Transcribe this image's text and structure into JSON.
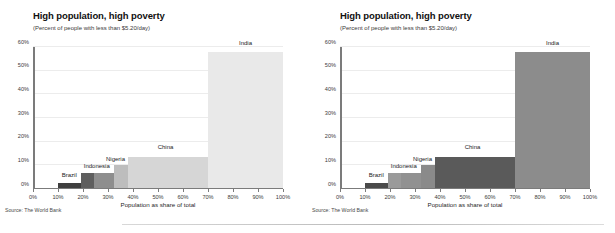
{
  "charts": [
    {
      "id": "chart-left",
      "title": "High population, high poverty",
      "subtitle": "(Percent of people with less than $5.20/day)",
      "source": "Source: The World Bank",
      "xlabel": "Population as share of total"
    },
    {
      "id": "chart-right",
      "title": "High population, high poverty",
      "subtitle": "(Percent of people with less than $5.20/day)",
      "source": "Source: The World Bank",
      "xlabel": "Population as share of total"
    }
  ],
  "chart_data": [
    {
      "type": "bar",
      "variant": "light-palette",
      "title": "High population, high poverty",
      "subtitle": "(Percent of people with less than $5.20/day)",
      "xlabel": "Population as share of total",
      "ylabel": "",
      "source": "Source: The World Bank",
      "xlim": [
        0,
        100
      ],
      "ylim": [
        0,
        60
      ],
      "grid": true,
      "legend": "none",
      "xticks": [
        "0%",
        "10%",
        "20%",
        "30%",
        "40%",
        "50%",
        "60%",
        "70%",
        "80%",
        "90%",
        "100%"
      ],
      "xtick_values": [
        0,
        10,
        20,
        30,
        40,
        50,
        60,
        70,
        80,
        90,
        100
      ],
      "yticks": [
        "0%",
        "10%",
        "20%",
        "30%",
        "40%",
        "50%",
        "60%"
      ],
      "ytick_values": [
        0,
        10,
        20,
        30,
        40,
        50,
        60
      ],
      "bars": [
        {
          "label": "Brazil",
          "x_start": 10.0,
          "x_end": 19.0,
          "value": 2.5,
          "color": "#3f3f3f",
          "label_x": 14.5,
          "label_y": 4.6
        },
        {
          "label": "Indonesia",
          "x_start": 19.0,
          "x_end": 24.5,
          "value": 6.8,
          "color": "#5e5e5e",
          "label_x": 25.5,
          "label_y": 8.3
        },
        {
          "label": "Nigeria",
          "x_start": 24.5,
          "x_end": 32.5,
          "value": 6.8,
          "color": "#8e8e8e",
          "label_x": 33.0,
          "label_y": 11.5
        },
        {
          "label": "",
          "x_start": 32.5,
          "x_end": 38.0,
          "value": 10.0,
          "color": "#bdbdbd",
          "label_x": null,
          "label_y": null
        },
        {
          "label": "China",
          "x_start": 38.0,
          "x_end": 70.0,
          "value": 13.4,
          "color": "#d6d6d6",
          "label_x": 53.0,
          "label_y": 16.3
        },
        {
          "label": "India",
          "x_start": 70.0,
          "x_end": 100.0,
          "value": 57.8,
          "color": "#e9e9e9",
          "label_x": 85.0,
          "label_y": 60.5
        }
      ]
    },
    {
      "type": "bar",
      "variant": "dark-palette",
      "title": "High population, high poverty",
      "subtitle": "(Percent of people with less than $5.20/day)",
      "xlabel": "Population as share of total",
      "ylabel": "",
      "source": "Source: The World Bank",
      "xlim": [
        0,
        100
      ],
      "ylim": [
        0,
        60
      ],
      "grid": true,
      "legend": "none",
      "xticks": [
        "0%",
        "10%",
        "20%",
        "30%",
        "40%",
        "50%",
        "60%",
        "70%",
        "80%",
        "90%",
        "100%"
      ],
      "xtick_values": [
        0,
        10,
        20,
        30,
        40,
        50,
        60,
        70,
        80,
        90,
        100
      ],
      "yticks": [
        "0%",
        "10%",
        "20%",
        "30%",
        "40%",
        "50%",
        "60%"
      ],
      "ytick_values": [
        0,
        10,
        20,
        30,
        40,
        50,
        60
      ],
      "bars": [
        {
          "label": "Brazil",
          "x_start": 10.0,
          "x_end": 19.0,
          "value": 2.5,
          "color": "#4a4a4a",
          "label_x": 14.5,
          "label_y": 4.6
        },
        {
          "label": "Indonesia",
          "x_start": 19.0,
          "x_end": 24.5,
          "value": 6.8,
          "color": "#9a9a9a",
          "label_x": 25.5,
          "label_y": 8.3
        },
        {
          "label": "Nigeria",
          "x_start": 24.5,
          "x_end": 32.5,
          "value": 6.8,
          "color": "#919191",
          "label_x": 33.0,
          "label_y": 11.5
        },
        {
          "label": "",
          "x_start": 32.5,
          "x_end": 38.0,
          "value": 10.0,
          "color": "#8a8a8a",
          "label_x": null,
          "label_y": null
        },
        {
          "label": "China",
          "x_start": 38.0,
          "x_end": 70.0,
          "value": 13.4,
          "color": "#5a5a5a",
          "label_x": 53.0,
          "label_y": 16.3
        },
        {
          "label": "India",
          "x_start": 70.0,
          "x_end": 100.0,
          "value": 57.8,
          "color": "#8c8c8c",
          "label_x": 85.0,
          "label_y": 60.5
        }
      ]
    }
  ]
}
